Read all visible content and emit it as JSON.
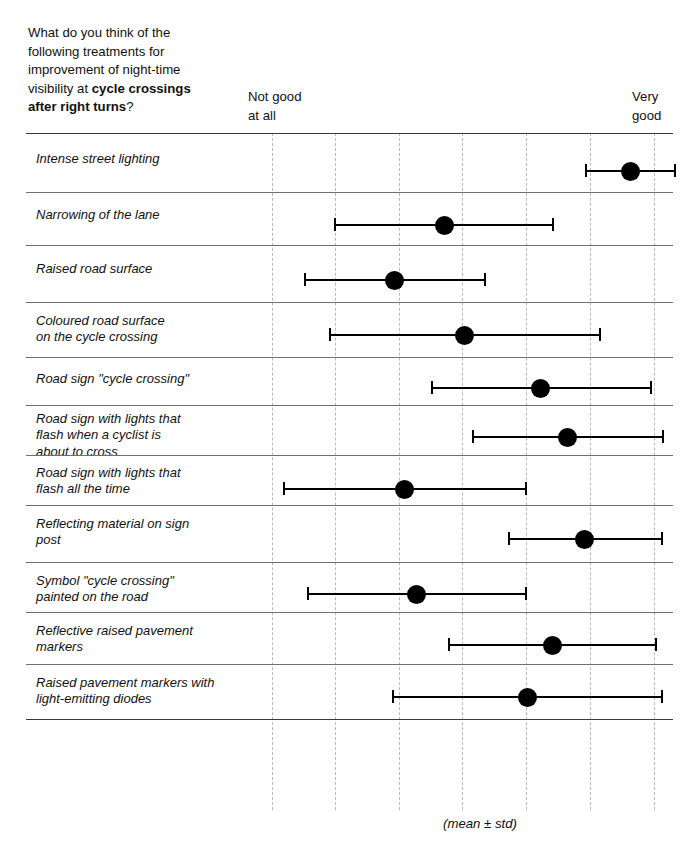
{
  "header": {
    "question_line1": "What do you think of the",
    "question_line2": "following treatments for",
    "question_line3": "improvement of night-time",
    "question_line4_prefix": "visibility at ",
    "question_line4_bold": "cycle crossings",
    "question_line5_bold": "after right turns",
    "question_line5_suffix": "?",
    "anchor_low_line1": "Not good",
    "anchor_low_line2": "at all",
    "anchor_high_line1": "Very",
    "anchor_high_line2": "good"
  },
  "footer": {
    "note": "(mean ± std)"
  },
  "chart_data": {
    "type": "scatter",
    "title": "What do you think of the following treatments for improvement of night-time visibility at cycle crossings after right turns?",
    "xlabel": "",
    "ylabel": "",
    "x_anchor_low": "Not good at all",
    "x_anchor_high": "Very good",
    "xlim": [
      1,
      7
    ],
    "grid": true,
    "gridlines_x": [
      1,
      2,
      3,
      4,
      5,
      6,
      7
    ],
    "legend": "none",
    "annotation": "(mean ± std)",
    "error_type": "std",
    "categories": [
      "Intense street lighting",
      "Narrowing of the lane",
      "Raised road surface",
      "Coloured road surface on the cycle crossing",
      "Road sign \"cycle crossing\"",
      "Road sign with lights that flash when a cyclist is about to cross",
      "Road sign with lights that flash all the time",
      "Reflecting material on sign post",
      "Symbol \"cycle crossing\" painted on the road",
      "Reflective raised pavement markers",
      "Raised pavement markers with light-emitting diodes"
    ],
    "means": [
      6.63,
      3.7,
      2.92,
      4.02,
      5.22,
      5.64,
      3.1,
      5.91,
      3.28,
      5.41,
      5.01
    ],
    "std": [
      0.71,
      1.71,
      1.4,
      2.12,
      1.71,
      1.49,
      1.9,
      1.2,
      1.71,
      1.63,
      2.11
    ],
    "lower": [
      5.92,
      1.99,
      1.52,
      1.9,
      3.51,
      4.15,
      1.2,
      4.71,
      1.57,
      3.78,
      2.9
    ],
    "upper": [
      7.34,
      5.41,
      4.32,
      6.14,
      6.93,
      7.13,
      5.0,
      7.11,
      4.99,
      7.04,
      7.12
    ]
  },
  "rows": [
    {
      "label_lines": [
        "Intense street lighting"
      ],
      "label_top": 18,
      "row_top": 0,
      "row_height": 59,
      "bar_y": 37,
      "lo_px": 585,
      "mean_px": 630,
      "hi_px": 674
    },
    {
      "label_lines": [
        "Narrowing of the lane"
      ],
      "label_top": 15,
      "row_top": 59,
      "row_height": 53,
      "bar_y": 32,
      "lo_px": 334,
      "mean_px": 444,
      "hi_px": 552
    },
    {
      "label_lines": [
        "Raised road surface"
      ],
      "label_top": 16,
      "row_top": 112,
      "row_height": 57,
      "bar_y": 34,
      "lo_px": 304,
      "mean_px": 394,
      "hi_px": 484
    },
    {
      "label_lines": [
        "Coloured road surface",
        "on the cycle crossing"
      ],
      "label_top": 11,
      "row_top": 169,
      "row_height": 55,
      "bar_y": 32,
      "lo_px": 329,
      "mean_px": 464,
      "hi_px": 599
    },
    {
      "label_lines": [
        "Road sign \"cycle crossing\""
      ],
      "label_top": 14,
      "row_top": 224,
      "row_height": 48,
      "bar_y": 30,
      "lo_px": 431,
      "mean_px": 540,
      "hi_px": 650
    },
    {
      "label_lines": [
        "Road sign with lights that",
        "flash when a cyclist is",
        "about to cross"
      ],
      "label_top": 6,
      "row_top": 272,
      "row_height": 50,
      "bar_y": 31,
      "lo_px": 472,
      "mean_px": 567,
      "hi_px": 662
    },
    {
      "label_lines": [
        "Road sign with lights that",
        "flash all the time"
      ],
      "label_top": 10,
      "row_top": 322,
      "row_height": 50,
      "bar_y": 33,
      "lo_px": 283,
      "mean_px": 404,
      "hi_px": 525
    },
    {
      "label_lines": [
        "Reflecting material on sign",
        "post"
      ],
      "label_top": 11,
      "row_top": 372,
      "row_height": 57,
      "bar_y": 33,
      "lo_px": 508,
      "mean_px": 584,
      "hi_px": 661
    },
    {
      "label_lines": [
        "Symbol \"cycle crossing\"",
        "painted on the road"
      ],
      "label_top": 11,
      "row_top": 429,
      "row_height": 50,
      "bar_y": 31,
      "lo_px": 307,
      "mean_px": 416,
      "hi_px": 525
    },
    {
      "label_lines": [
        "Reflective raised pavement",
        "markers"
      ],
      "label_top": 11,
      "row_top": 479,
      "row_height": 52,
      "bar_y": 32,
      "lo_px": 448,
      "mean_px": 552,
      "hi_px": 655
    },
    {
      "label_lines": [
        "Raised pavement markers with",
        "light-emitting diodes"
      ],
      "label_top": 11,
      "row_top": 531,
      "row_height": 55,
      "bar_y": 32,
      "lo_px": 392,
      "mean_px": 527,
      "hi_px": 661
    }
  ],
  "geometry": {
    "plot_left": 26,
    "plot_top": 133,
    "plot_width": 647,
    "plot_height": 677,
    "gridlines_px": [
      272,
      335,
      399,
      462,
      526,
      590,
      654
    ]
  }
}
